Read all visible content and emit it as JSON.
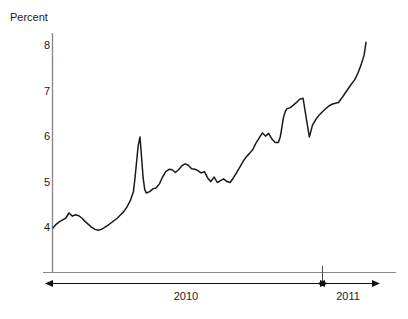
{
  "chart_data": {
    "type": "line",
    "title": "",
    "subtitle": "",
    "ylabel": "Percent",
    "xlabel": "",
    "ylim": [
      3.3,
      8.35
    ],
    "yticks": [
      4,
      5,
      6,
      7,
      8
    ],
    "ytick_labels": [
      "4",
      "5",
      "6",
      "7",
      "8"
    ],
    "grid": false,
    "legend": null,
    "axis_color": "#7a7a7a",
    "line_color": "#1a1a1a",
    "background": "#ffffff",
    "x_spans": [
      {
        "label": "2010",
        "start_frac": 0.0,
        "end_frac": 0.862
      },
      {
        "label": "2011",
        "start_frac": 0.862,
        "end_frac": 1.0
      }
    ],
    "series": [
      {
        "name": "Percent",
        "x": [
          0.0,
          0.01,
          0.021,
          0.031,
          0.041,
          0.051,
          0.062,
          0.072,
          0.082,
          0.092,
          0.103,
          0.113,
          0.123,
          0.134,
          0.144,
          0.154,
          0.164,
          0.175,
          0.185,
          0.195,
          0.206,
          0.216,
          0.226,
          0.236,
          0.247,
          0.257,
          0.262,
          0.267,
          0.272,
          0.278,
          0.283,
          0.288,
          0.293,
          0.298,
          0.309,
          0.319,
          0.329,
          0.34,
          0.35,
          0.36,
          0.371,
          0.381,
          0.391,
          0.401,
          0.412,
          0.422,
          0.432,
          0.443,
          0.453,
          0.463,
          0.473,
          0.484,
          0.494,
          0.504,
          0.515,
          0.525,
          0.535,
          0.545,
          0.556,
          0.566,
          0.576,
          0.587,
          0.597,
          0.607,
          0.617,
          0.628,
          0.638,
          0.648,
          0.659,
          0.669,
          0.679,
          0.689,
          0.7,
          0.71,
          0.72,
          0.726,
          0.731,
          0.736,
          0.742,
          0.747,
          0.757,
          0.768,
          0.778,
          0.788,
          0.799,
          0.809,
          0.819,
          0.829,
          0.84,
          0.85,
          0.86,
          0.871,
          0.881,
          0.891,
          0.902,
          0.912,
          0.922,
          0.932,
          0.943,
          0.953,
          0.963,
          0.974,
          0.984,
          0.994,
          1.0
        ],
        "values": [
          4.0,
          4.08,
          4.14,
          4.18,
          4.22,
          4.33,
          4.26,
          4.29,
          4.27,
          4.22,
          4.14,
          4.08,
          4.02,
          3.97,
          3.95,
          3.97,
          4.01,
          4.06,
          4.11,
          4.16,
          4.22,
          4.29,
          4.36,
          4.46,
          4.6,
          4.8,
          5.1,
          5.45,
          5.8,
          6.0,
          5.55,
          5.1,
          4.85,
          4.77,
          4.8,
          4.86,
          4.88,
          4.97,
          5.12,
          5.24,
          5.29,
          5.28,
          5.22,
          5.28,
          5.37,
          5.41,
          5.38,
          5.3,
          5.29,
          5.26,
          5.21,
          5.24,
          5.1,
          5.02,
          5.12,
          5.0,
          5.04,
          5.08,
          5.02,
          5.0,
          5.1,
          5.22,
          5.34,
          5.46,
          5.56,
          5.64,
          5.72,
          5.86,
          5.98,
          6.09,
          6.02,
          6.08,
          5.95,
          5.88,
          5.88,
          6.0,
          6.2,
          6.42,
          6.56,
          6.62,
          6.64,
          6.7,
          6.76,
          6.83,
          6.85,
          6.42,
          6.0,
          6.26,
          6.39,
          6.48,
          6.55,
          6.62,
          6.68,
          6.72,
          6.74,
          6.76,
          6.85,
          6.95,
          7.06,
          7.16,
          7.25,
          7.4,
          7.58,
          7.8,
          8.08
        ]
      }
    ]
  },
  "labels": {
    "y_axis_title": "Percent"
  }
}
